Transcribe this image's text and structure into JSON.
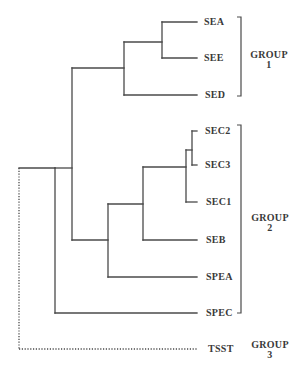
{
  "diagram": {
    "type": "dendrogram",
    "colors": {
      "line": "#4a4a4a",
      "text": "#3a3a3a",
      "background": "#ffffff"
    },
    "leaves": [
      {
        "id": "SEA",
        "label": "SEA",
        "y": 22
      },
      {
        "id": "SEE",
        "label": "SEE",
        "y": 58
      },
      {
        "id": "SED",
        "label": "SED",
        "y": 95
      },
      {
        "id": "SEC2",
        "label": "SEC2",
        "y": 131
      },
      {
        "id": "SEC3",
        "label": "SEC3",
        "y": 165
      },
      {
        "id": "SEC1",
        "label": "SEC1",
        "y": 202
      },
      {
        "id": "SEB",
        "label": "SEB",
        "y": 240
      },
      {
        "id": "SPEA",
        "label": "SPEA",
        "y": 277
      },
      {
        "id": "SPEC",
        "label": "SPEC",
        "y": 313
      },
      {
        "id": "TSST",
        "label": "TSST",
        "y": 349,
        "dotted": true
      }
    ],
    "groups": [
      {
        "id": "group-1",
        "line1": "GROUP",
        "line2": "1",
        "members": [
          "SEA",
          "SEE",
          "SED"
        ]
      },
      {
        "id": "group-2",
        "line1": "GROUP",
        "line2": "2",
        "members": [
          "SEC2",
          "SEC3",
          "SEC1",
          "SEB",
          "SPEA",
          "SPEC"
        ]
      },
      {
        "id": "group-3",
        "line1": "GROUP",
        "line2": "3",
        "members": [
          "TSST"
        ]
      }
    ],
    "topology": "((((SEA,SEE),SED),((((SEC2,SEC3),SEC1),SEB),SPEA)),SPEC),TSST"
  }
}
